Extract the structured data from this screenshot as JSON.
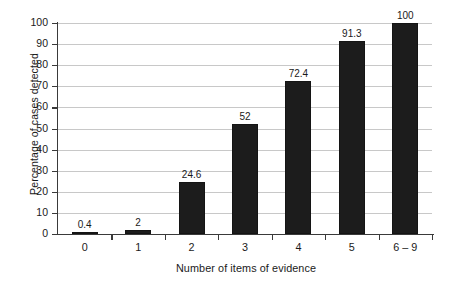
{
  "chart_data": {
    "type": "bar",
    "title": "",
    "xlabel": "Number of items of evidence",
    "ylabel": "Percentage of cases detected",
    "categories": [
      "0",
      "1",
      "2",
      "3",
      "4",
      "5",
      "6 – 9"
    ],
    "values": [
      0.4,
      2,
      24.6,
      52,
      72.4,
      91.3,
      100
    ],
    "data_labels": [
      "0.4",
      "2",
      "24.6",
      "52",
      "72.4",
      "91.3",
      "100"
    ],
    "ylim": [
      0,
      100
    ],
    "ytick_labels": [
      "0",
      "10",
      "20",
      "30",
      "40",
      "50",
      "60",
      "70",
      "80",
      "90",
      "100"
    ],
    "ytick_values": [
      0,
      10,
      20,
      30,
      40,
      50,
      60,
      70,
      80,
      90,
      100
    ],
    "grid": "horizontal",
    "legend": "none",
    "bar_fill": "#1c1c1c",
    "bar_pattern": "dotted-cross-hatch",
    "gridline_color": "#c8c8c8",
    "axis_color": "#3a3a3a",
    "background": "#ffffff"
  }
}
